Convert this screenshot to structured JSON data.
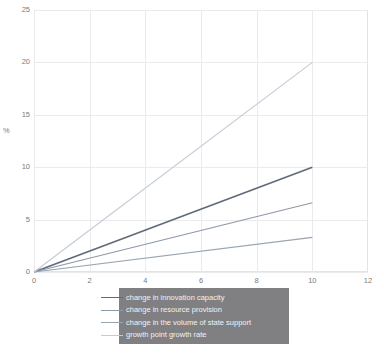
{
  "chart_data": {
    "type": "line",
    "title": "",
    "subtitle": "",
    "xlabel": "",
    "ylabel": "%",
    "xlim": [
      0,
      12
    ],
    "ylim": [
      0,
      25
    ],
    "x_ticks": [
      "0",
      "2",
      "4",
      "6",
      "8",
      "10",
      "12"
    ],
    "y_ticks": [
      "0",
      "5",
      "10",
      "15",
      "20",
      "25"
    ],
    "grid": true,
    "legend_position": "bottom-center-overlay",
    "x": [
      0,
      10
    ],
    "series": [
      {
        "name": "change in innovation  capacity",
        "values": [
          0,
          10
        ],
        "color": "#5f6b7a"
      },
      {
        "name": "change in resource provision",
        "values": [
          0,
          6.6
        ],
        "color": "#8d99a8"
      },
      {
        "name": "change in the volume of state support",
        "values": [
          0,
          3.3
        ],
        "color": "#98a4b2"
      },
      {
        "name": "growth point growth rate",
        "values": [
          0,
          20
        ],
        "color": "#c2cbd6"
      }
    ]
  },
  "legend": {
    "items": [
      {
        "label": "change in innovation  capacity"
      },
      {
        "label": "change in resource provision"
      },
      {
        "label": "change in the volume of state support"
      },
      {
        "label": "growth point growth rate"
      }
    ],
    "background_color": "#808083",
    "text_color": "#f2f2f2"
  },
  "axes": {
    "y_title": "%",
    "y_tick_labels": [
      "25",
      "20",
      "15",
      "10",
      "5",
      "0"
    ],
    "x_tick_labels": [
      "0",
      "2",
      "4",
      "6",
      "8",
      "10",
      "12"
    ]
  },
  "colors": {
    "grid": "#ebebed",
    "frame": "#e3e3e5",
    "tick_text": "#7a7a7a",
    "background": "#ffffff"
  }
}
